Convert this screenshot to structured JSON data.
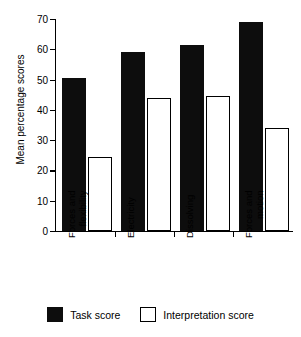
{
  "chart_data": {
    "type": "bar",
    "title": "",
    "xlabel": "",
    "ylabel": "Mean percentage scores",
    "ylim": [
      0,
      70
    ],
    "yticks": [
      0,
      10,
      20,
      30,
      40,
      50,
      60,
      70
    ],
    "grid": false,
    "legend_position": "bottom",
    "categories": [
      "Forces and flexibility",
      "Electricity",
      "Dissolving",
      "Forces and motion"
    ],
    "category_lines": [
      [
        "Forces and",
        "flexibility"
      ],
      [
        "Electricity",
        ""
      ],
      [
        "Dissolving",
        ""
      ],
      [
        "Forces and",
        "motion"
      ]
    ],
    "series": [
      {
        "name": "Task score",
        "color": "#0d0d0d",
        "values": [
          50.5,
          59,
          61.5,
          69
        ]
      },
      {
        "name": "Interpretation score",
        "color": "#ffffff",
        "values": [
          24.5,
          44,
          44.5,
          34
        ]
      }
    ]
  },
  "legend": {
    "items": [
      {
        "label": "Task score",
        "style": "filled"
      },
      {
        "label": "Interpretation score",
        "style": "hollow"
      }
    ]
  },
  "axis": {
    "y_title": "Mean percentage scores",
    "y_tick_labels": [
      "0",
      "10",
      "20",
      "30",
      "40",
      "50",
      "60",
      "70"
    ]
  }
}
